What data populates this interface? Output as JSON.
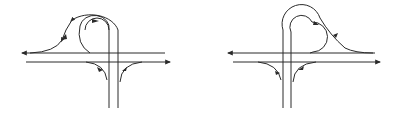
{
  "diagram": {
    "stroke_color": "#2a2a2a",
    "background": "#ffffff",
    "left_interchange": {
      "label": "",
      "loop_side": "left"
    },
    "right_interchange": {
      "label": "",
      "loop_side": "right"
    }
  }
}
